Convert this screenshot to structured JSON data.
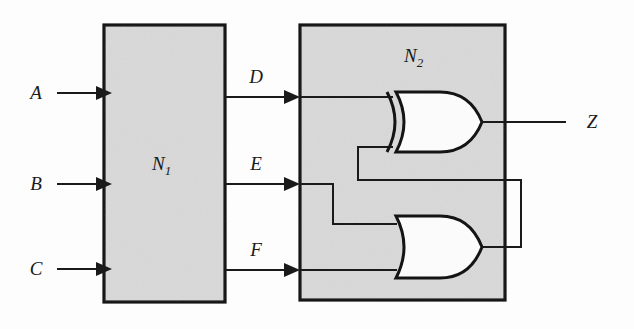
{
  "diagram": {
    "background_color": "#fdfdfd",
    "block_fill_color": "#d9d9d9",
    "line_color": "#1a1a1a",
    "gate_fill_color": "#fbfbfb"
  },
  "blocks": [
    {
      "id": "n1",
      "label_base": "N",
      "label_sub": "1",
      "label_full": "N1"
    },
    {
      "id": "n2",
      "label_base": "N",
      "label_sub": "2",
      "label_full": "N2"
    }
  ],
  "inputs": [
    {
      "id": "a",
      "label": "A"
    },
    {
      "id": "b",
      "label": "B"
    },
    {
      "id": "c",
      "label": "C"
    }
  ],
  "intermediate_signals": [
    {
      "id": "d",
      "label": "D"
    },
    {
      "id": "e",
      "label": "E"
    },
    {
      "id": "f",
      "label": "F"
    }
  ],
  "outputs": [
    {
      "id": "z",
      "label": "Z"
    }
  ],
  "gates": [
    {
      "id": "xor-gate",
      "type": "XOR",
      "inputs": [
        "D",
        "or-gate-output"
      ],
      "output": "Z"
    },
    {
      "id": "or-gate",
      "type": "OR",
      "inputs": [
        "E",
        "F"
      ],
      "output": "or-gate-output"
    }
  ]
}
